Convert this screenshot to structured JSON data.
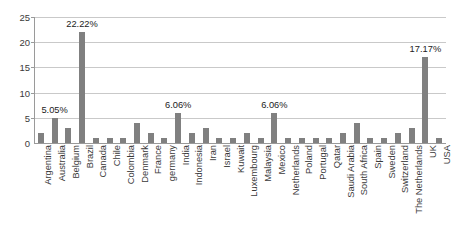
{
  "chart_data": {
    "type": "bar",
    "title": "",
    "subtitle": "",
    "xlabel": "",
    "ylabel": "",
    "ylim": [
      0,
      25
    ],
    "ytick_labels": [
      "0",
      "5",
      "10",
      "15",
      "20",
      "25"
    ],
    "yticks": [
      0,
      5,
      10,
      15,
      20,
      25
    ],
    "grid": true,
    "legend": false,
    "bar_color": "#808080",
    "categories": [
      "Argentina",
      "Australia",
      "Belgium",
      "Brazil",
      "Canada",
      "Chile",
      "Colombia",
      "Denmark",
      "France",
      "germany",
      "India",
      "Indonesia",
      "Iran",
      "Israel",
      "Kuwait",
      "Luxembourg",
      "Malaysia",
      "Mexico",
      "Netherlands",
      "Poland",
      "Portugal",
      "Qatar",
      "Saudi Arabia",
      "South Africa",
      "Spain",
      "Sweden",
      "Switzerland",
      "The Netherlands",
      "UK",
      "USA"
    ],
    "values": [
      2,
      5,
      3,
      22,
      1,
      1,
      1,
      4,
      2,
      1,
      6,
      2,
      3,
      1,
      1,
      2,
      1,
      6,
      1,
      1,
      1,
      1,
      2,
      4,
      1,
      1,
      2,
      3,
      17,
      1
    ],
    "data_labels": [
      {
        "index": 1,
        "text": "5.05%"
      },
      {
        "index": 3,
        "text": "22.22%"
      },
      {
        "index": 10,
        "text": "6.06%"
      },
      {
        "index": 17,
        "text": "6.06%"
      },
      {
        "index": 28,
        "text": "17.17%"
      }
    ]
  }
}
